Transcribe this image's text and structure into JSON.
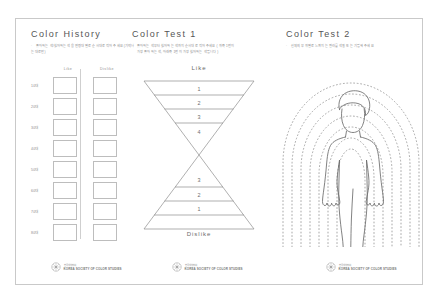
{
  "document": {
    "background_color": "#ffffff",
    "sheet_border_color": "#c9c9c9"
  },
  "panels": {
    "history": {
      "title": "Color History",
      "description": "좋아하는 색/싫어하는 색을 연령대 별로 순서대로 적어 주세요 (기억나는 대로만)",
      "table": {
        "columns": [
          "Like",
          "Dislike"
        ],
        "rows": [
          {
            "label": "10대"
          },
          {
            "label": "20대"
          },
          {
            "label": "30대"
          },
          {
            "label": "40대"
          },
          {
            "label": "50대"
          },
          {
            "label": "60대"
          },
          {
            "label": "70대"
          },
          {
            "label": "80대"
          }
        ]
      },
      "logo": {
        "line1": "한국색채학회",
        "line2": "KOREA SOCIETY OF COLOR STUDIES"
      }
    },
    "test1": {
      "title": "Color Test 1",
      "description_line1": "좋아하는 색부터 싫어하는 색까지 순서대로 적어 주세요 ( 위쪽 1번이",
      "description_line2": "가장 좋아하는 색, 아래쪽 1번이 가장 싫어하는 색입니다 )",
      "top_label": "Like",
      "bottom_label": "Dislike",
      "top_levels": [
        "1",
        "2",
        "3",
        "4"
      ],
      "bottom_levels": [
        "3",
        "2",
        "1"
      ],
      "logo": {
        "line1": "한국색채학회",
        "line2": "KOREA SOCIETY OF COLOR STUDIES"
      }
    },
    "test2": {
      "title": "Color Test 2",
      "description": "신체의 부위별로 느껴지는 컬러를 색칠 또는 기입해 주세요",
      "aura_ring_count": 7,
      "figure": "human-body-outline",
      "logo": {
        "line1": "한국색채학회",
        "line2": "KOREA SOCIETY OF COLOR STUDIES"
      }
    }
  }
}
